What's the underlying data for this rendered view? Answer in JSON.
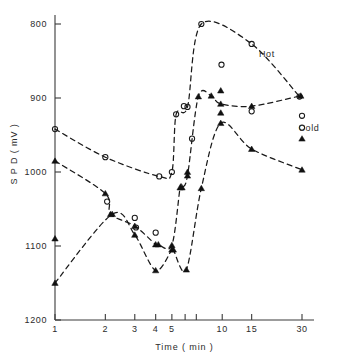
{
  "chart_data": {
    "type": "scatter",
    "title": "",
    "subtitle": "",
    "xlabel": "Time ( min )",
    "ylabel": "S P D ( mV )",
    "xscale": "log",
    "yscale": "linear",
    "y_inverted": true,
    "xlim": [
      1,
      30
    ],
    "ylim": [
      800,
      1200
    ],
    "grid": false,
    "legend_position": "inline-right",
    "x_ticks": [
      {
        "value": 1,
        "label": "1"
      },
      {
        "value": 2,
        "label": "2"
      },
      {
        "value": 3,
        "label": "3"
      },
      {
        "value": 4,
        "label": "4"
      },
      {
        "value": 5,
        "label": "5"
      },
      {
        "value": 6,
        "label": ""
      },
      {
        "value": 7,
        "label": ""
      },
      {
        "value": 10,
        "label": "10"
      },
      {
        "value": 15,
        "label": "15"
      },
      {
        "value": 30,
        "label": "30"
      }
    ],
    "y_ticks": [
      {
        "value": 800,
        "label": "800"
      },
      {
        "value": 900,
        "label": "900"
      },
      {
        "value": 1000,
        "label": "1000"
      },
      {
        "value": 1100,
        "label": "1100"
      },
      {
        "value": 1200,
        "label": "1200"
      }
    ],
    "annotations": [
      {
        "text": "Hot",
        "x": 18.5,
        "y": 845
      },
      {
        "text": "Cold",
        "x": 33.0,
        "y": 945
      }
    ],
    "marker_styles": {
      "open_circle": "Hot (open circle)",
      "filled_triangle": "Cold (filled triangle)"
    },
    "series": [
      {
        "name": "Hot upper branch",
        "marker": "open_circle",
        "curve": true,
        "points": [
          {
            "x": 1,
            "y": 942
          },
          {
            "x": 2,
            "y": 980
          },
          {
            "x": 4.2,
            "y": 1006
          },
          {
            "x": 5,
            "y": 1000
          },
          {
            "x": 5.3,
            "y": 922
          },
          {
            "x": 6.2,
            "y": 912
          },
          {
            "x": 7.5,
            "y": 800
          },
          {
            "x": 15,
            "y": 827
          },
          {
            "x": 29,
            "y": 898
          }
        ]
      },
      {
        "name": "Cold upper branch",
        "marker": "filled_triangle",
        "curve": true,
        "points": [
          {
            "x": 1,
            "y": 985
          },
          {
            "x": 2,
            "y": 1029
          },
          {
            "x": 2.15,
            "y": 1057
          },
          {
            "x": 3,
            "y": 1073
          },
          {
            "x": 4,
            "y": 1098
          },
          {
            "x": 4.15,
            "y": 1098
          },
          {
            "x": 5,
            "y": 1099
          },
          {
            "x": 5.6,
            "y": 1021
          },
          {
            "x": 5.75,
            "y": 1021
          },
          {
            "x": 6.2,
            "y": 1005
          },
          {
            "x": 7.2,
            "y": 898
          },
          {
            "x": 8.6,
            "y": 897
          },
          {
            "x": 9.8,
            "y": 908
          },
          {
            "x": 15,
            "y": 911
          },
          {
            "x": 29.5,
            "y": 897
          }
        ]
      },
      {
        "name": "Cold lower branch",
        "marker": "filled_triangle",
        "curve": true,
        "points": [
          {
            "x": 1,
            "y": 1150
          },
          {
            "x": 2.2,
            "y": 1057
          },
          {
            "x": 3,
            "y": 1085
          },
          {
            "x": 4,
            "y": 1133
          },
          {
            "x": 5,
            "y": 1105
          },
          {
            "x": 5.1,
            "y": 1105
          },
          {
            "x": 6.1,
            "y": 1132
          },
          {
            "x": 7.5,
            "y": 1022
          },
          {
            "x": 9.8,
            "y": 934
          },
          {
            "x": 15,
            "y": 969
          },
          {
            "x": 30,
            "y": 997
          }
        ]
      },
      {
        "name": "Hot scatter (unconnected)",
        "marker": "open_circle",
        "curve": false,
        "points": [
          {
            "x": 2.05,
            "y": 1040
          },
          {
            "x": 3,
            "y": 1062
          },
          {
            "x": 3.05,
            "y": 1075
          },
          {
            "x": 4,
            "y": 1082
          },
          {
            "x": 5.9,
            "y": 911
          },
          {
            "x": 6.6,
            "y": 955
          },
          {
            "x": 9.9,
            "y": 855
          },
          {
            "x": 15,
            "y": 918
          },
          {
            "x": 30,
            "y": 924
          },
          {
            "x": 30,
            "y": 940
          }
        ]
      },
      {
        "name": "Cold scatter (unconnected)",
        "marker": "filled_triangle",
        "curve": false,
        "points": [
          {
            "x": 1,
            "y": 1090
          },
          {
            "x": 6.2,
            "y": 1000
          },
          {
            "x": 9.8,
            "y": 890
          },
          {
            "x": 9.8,
            "y": 920
          },
          {
            "x": 30,
            "y": 955
          }
        ]
      }
    ]
  }
}
